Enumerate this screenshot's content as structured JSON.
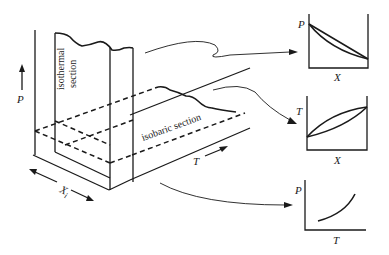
{
  "diagram": {
    "type": "phase-diagram-sections",
    "block": {
      "axes": {
        "vertical": "P",
        "depth": "X",
        "depth_subscript": "i",
        "horizontal": "T"
      },
      "sections": {
        "isothermal": {
          "line1": "isothermal",
          "line2": "section"
        },
        "isobaric": {
          "label": "isobaric section"
        }
      }
    },
    "panels": [
      {
        "name": "P-X diagram",
        "ylabel": "P",
        "xlabel": "X",
        "curves": "lens (two curves between endpoints, decreasing)"
      },
      {
        "name": "T-X diagram",
        "ylabel": "T",
        "xlabel": "X",
        "curves": "lens (two curves between endpoints, increasing)"
      },
      {
        "name": "P-T diagram",
        "ylabel": "P",
        "xlabel": "T",
        "curves": "single increasing convex curve"
      }
    ],
    "colors": {
      "ink": "#1a1a1a",
      "background": "#ffffff"
    }
  }
}
